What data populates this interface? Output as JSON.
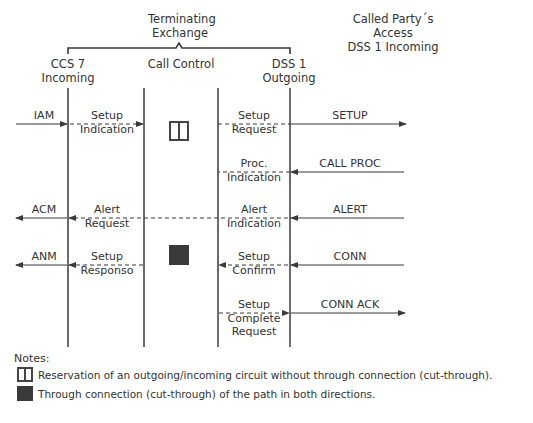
{
  "header": {
    "group_label_line1": "Terminating",
    "group_label_line2": "Exchange",
    "called_party_line1": "Called Party´s",
    "called_party_line2": "Access",
    "called_party_line3": "DSS 1 Incoming"
  },
  "columns": [
    {
      "id": "ccs7",
      "line1": "CCS 7",
      "line2": "Incoming"
    },
    {
      "id": "call_control",
      "line1": "Call Control",
      "line2": ""
    },
    {
      "id": "dss1_out",
      "line1": "DSS 1",
      "line2": "Outgoing"
    }
  ],
  "messages": [
    {
      "label": "IAM",
      "direction": "right",
      "style": "solid",
      "segment": "left-external"
    },
    {
      "label_line1": "Setup",
      "label_line2": "Indication",
      "direction": "right",
      "style": "dashed",
      "segment": "ccs7-to-callcontrol"
    },
    {
      "label_line1": "Setup",
      "label_line2": "Request",
      "direction": "right",
      "style": "dashed",
      "segment": "callcontrol-to-dss1"
    },
    {
      "label": "SETUP",
      "direction": "right",
      "style": "solid",
      "segment": "right-external"
    },
    {
      "label_line1": "Proc.",
      "label_line2": "Indication",
      "direction": "left",
      "style": "dashed",
      "segment": "dss1-to-callcontrol"
    },
    {
      "label": "CALL PROC",
      "direction": "left",
      "style": "solid",
      "segment": "right-external"
    },
    {
      "label": "ACM",
      "direction": "left",
      "style": "solid",
      "segment": "left-external"
    },
    {
      "label_line1": "Alert",
      "label_line2": "Request",
      "direction": "left",
      "style": "dashed",
      "segment": "callcontrol-to-ccs7"
    },
    {
      "label_line1": "Alert",
      "label_line2": "Indication",
      "direction": "left",
      "style": "dashed",
      "segment": "dss1-to-callcontrol"
    },
    {
      "label": "ALERT",
      "direction": "left",
      "style": "solid",
      "segment": "right-external"
    },
    {
      "label": "ANM",
      "direction": "left",
      "style": "solid",
      "segment": "left-external"
    },
    {
      "label_line1": "Setup",
      "label_line2": "Responso",
      "direction": "left",
      "style": "dashed",
      "segment": "callcontrol-to-ccs7"
    },
    {
      "label_line1": "Setup",
      "label_line2": "Confirm",
      "direction": "left",
      "style": "dashed",
      "segment": "dss1-to-callcontrol"
    },
    {
      "label": "CONN",
      "direction": "left",
      "style": "solid",
      "segment": "right-external"
    },
    {
      "label_line1": "Setup",
      "label_line2": "Complete",
      "label_line3": "Request",
      "direction": "right",
      "style": "dashed",
      "segment": "callcontrol-to-dss1"
    },
    {
      "label": "CONN ACK",
      "direction": "right",
      "style": "solid",
      "segment": "right-external"
    }
  ],
  "symbols": {
    "reservation": "open-split-square",
    "through_connection": "filled-square"
  },
  "notes": {
    "title": "Notes:",
    "items": [
      {
        "symbol": "open-split-square",
        "text": "Reservation of an outgoing/incoming circuit without through connection (cut-through)."
      },
      {
        "symbol": "filled-square",
        "text": "Through connection (cut-through) of the path in both directions."
      }
    ]
  },
  "colors": {
    "line": "#3a3a3a",
    "text": "#333333",
    "background": "#ffffff"
  }
}
